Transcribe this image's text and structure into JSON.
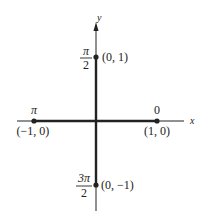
{
  "diagram": {
    "colors": {
      "ink": "#222222",
      "background": "#ffffff"
    },
    "axes": {
      "x_label": "x",
      "y_label": "y"
    },
    "points": [
      {
        "id": "top",
        "coord_label": "(0, 1)",
        "angle_label_num": "π",
        "angle_label_den": "2",
        "x": 0,
        "y": 1
      },
      {
        "id": "left",
        "coord_label": "(−1, 0)",
        "angle_label": "π",
        "x": -1,
        "y": 0
      },
      {
        "id": "right",
        "coord_label": "(1, 0)",
        "angle_label": "0",
        "x": 1,
        "y": 0
      },
      {
        "id": "bottom",
        "coord_label": "(0, −1)",
        "angle_label_num": "3π",
        "angle_label_den": "2",
        "x": 0,
        "y": -1
      }
    ]
  }
}
